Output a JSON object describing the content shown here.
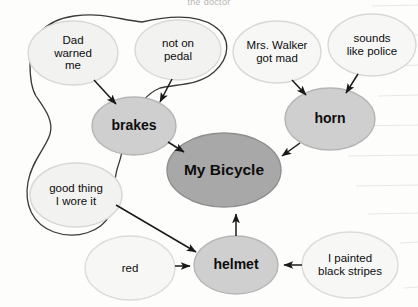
{
  "document": {
    "type": "concept-map",
    "heading_partial": "the doctor",
    "page_background": "#fdfdfc",
    "ruled_line_color": "#e6e4e0"
  },
  "palette": {
    "center_fill": "#a8a8a8",
    "main_fill": "#cfcfcf",
    "detail_fill": "#f2f2f1",
    "detail_stroke": "#d8d8d6",
    "main_stroke": "#b5b5b5",
    "center_stroke": "#8f8f8f",
    "arrow_color": "#1a1a1a",
    "boundary_color": "#3a3a3a",
    "text_color": "#0d0d0d"
  },
  "nodes": {
    "center": {
      "id": "my-bicycle",
      "label": "My Bicycle",
      "role": "center-topic",
      "cx": 224,
      "cy": 170,
      "rx": 57,
      "ry": 37
    },
    "main": [
      {
        "id": "brakes",
        "label": "brakes",
        "cx": 134,
        "cy": 126,
        "rx": 42,
        "ry": 29
      },
      {
        "id": "horn",
        "label": "horn",
        "cx": 330,
        "cy": 119,
        "rx": 45,
        "ry": 31
      },
      {
        "id": "helmet",
        "label": "helmet",
        "cx": 236,
        "cy": 265,
        "rx": 42,
        "ry": 29
      }
    ],
    "details": [
      {
        "id": "dad-warned-me",
        "label": "Dad\nwarned\nme",
        "cx": 73,
        "cy": 53,
        "rx": 45,
        "ry": 32
      },
      {
        "id": "not-on-pedal",
        "label": "not on\npedal",
        "cx": 178,
        "cy": 50,
        "rx": 43,
        "ry": 30
      },
      {
        "id": "mrs-walker-got-mad",
        "label": "Mrs. Walker\ngot mad",
        "cx": 277,
        "cy": 52,
        "rx": 44,
        "ry": 31
      },
      {
        "id": "sounds-like-police",
        "label": "sounds\nlike police",
        "cx": 372,
        "cy": 45,
        "rx": 44,
        "ry": 31
      },
      {
        "id": "good-thing-i-wore-it",
        "label": "good thing\nI wore it",
        "cx": 76,
        "cy": 195,
        "rx": 46,
        "ry": 32
      },
      {
        "id": "red",
        "label": "red",
        "cx": 130,
        "cy": 268,
        "rx": 45,
        "ry": 32
      },
      {
        "id": "i-painted-black-stripes",
        "label": "I painted\nblack stripes",
        "cx": 350,
        "cy": 265,
        "rx": 48,
        "ry": 33
      }
    ]
  },
  "arrows": [
    {
      "from": "dad-warned-me",
      "to": "brakes"
    },
    {
      "from": "not-on-pedal",
      "to": "brakes"
    },
    {
      "from": "brakes",
      "to": "my-bicycle"
    },
    {
      "from": "mrs-walker-got-mad",
      "to": "horn"
    },
    {
      "from": "sounds-like-police",
      "to": "horn"
    },
    {
      "from": "horn",
      "to": "my-bicycle"
    },
    {
      "from": "good-thing-i-wore-it",
      "to": "helmet"
    },
    {
      "from": "red",
      "to": "helmet"
    },
    {
      "from": "i-painted-black-stripes",
      "to": "helmet"
    },
    {
      "from": "helmet",
      "to": "my-bicycle"
    }
  ],
  "annotations": {
    "grouping_outline": {
      "id": "hand-drawn-grouping-outline",
      "encloses": [
        "dad-warned-me",
        "not-on-pedal",
        "good-thing-i-wore-it",
        "brakes"
      ]
    }
  }
}
